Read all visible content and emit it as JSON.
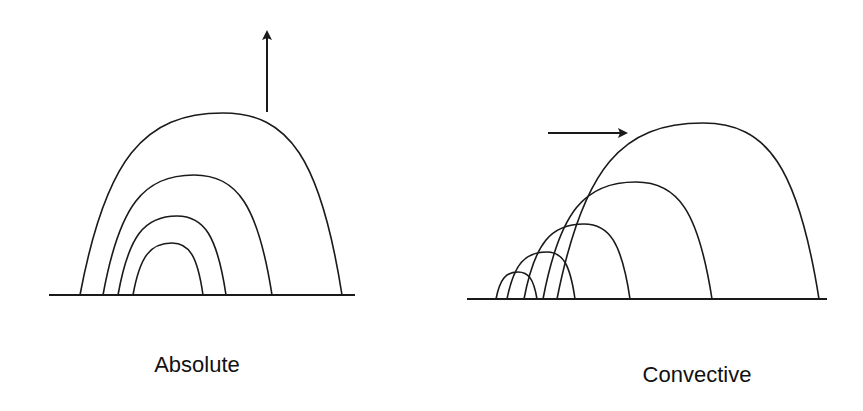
{
  "colors": {
    "stroke": "#1a1a1a",
    "background": "#ffffff",
    "text": "#111111"
  },
  "panels": [
    {
      "id": "absolute",
      "label": "Absolute",
      "label_pos": {
        "x": 197,
        "y": 352
      },
      "baseline": {
        "x1": 49,
        "x2": 355,
        "y": 295
      },
      "arrow": {
        "direction": "up",
        "x1": 267,
        "y1": 112,
        "x2": 267,
        "y2": 35
      },
      "arches": [
        {
          "x0": 80,
          "x1": 342,
          "px": 223,
          "py": 113
        },
        {
          "x0": 103,
          "x1": 272,
          "px": 194,
          "py": 175
        },
        {
          "x0": 118,
          "x1": 226,
          "px": 177,
          "py": 216
        },
        {
          "x0": 133,
          "x1": 203,
          "px": 172,
          "py": 243
        }
      ]
    },
    {
      "id": "convective",
      "label": "Convective",
      "label_pos": {
        "x": 697,
        "y": 362
      },
      "baseline": {
        "x1": 467,
        "x2": 827,
        "y": 299
      },
      "arrow": {
        "direction": "right",
        "x1": 548,
        "y1": 133,
        "x2": 623,
        "y2": 133
      },
      "arches": [
        {
          "x0": 557,
          "x1": 819,
          "px": 703,
          "py": 123
        },
        {
          "x0": 543,
          "x1": 712,
          "px": 636,
          "py": 182
        },
        {
          "x0": 524,
          "x1": 630,
          "px": 584,
          "py": 224
        },
        {
          "x0": 507,
          "x1": 575,
          "px": 547,
          "py": 252
        },
        {
          "x0": 496,
          "x1": 537,
          "px": 518,
          "py": 272
        }
      ]
    }
  ]
}
